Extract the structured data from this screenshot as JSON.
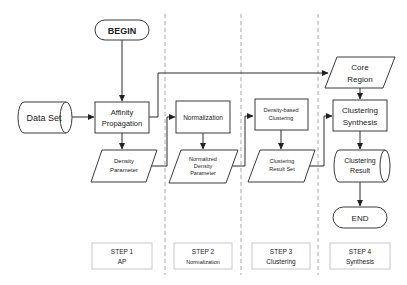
{
  "diagram": {
    "type": "flowchart",
    "nodes": {
      "begin": {
        "label": "BEGIN",
        "shape": "terminal"
      },
      "data_set": {
        "label": "Data Set",
        "shape": "cylinder"
      },
      "affinity": {
        "line1": "Affinity",
        "line2": "Propagation",
        "shape": "process"
      },
      "density_param": {
        "line1": "Density",
        "line2": "Parameter",
        "shape": "data"
      },
      "normalization": {
        "label": "Normalization",
        "shape": "process"
      },
      "norm_density_param": {
        "line1": "Normalized",
        "line2": "Density",
        "line3": "Parameter",
        "shape": "data"
      },
      "density_clustering": {
        "line1": "Density-based",
        "line2": "Clustering",
        "shape": "process"
      },
      "cluster_result_set": {
        "line1": "Clustering",
        "line2": "Result Set",
        "shape": "data"
      },
      "core_region": {
        "line1": "Core",
        "line2": "Region",
        "shape": "data"
      },
      "cluster_synthesis": {
        "line1": "Clustering",
        "line2": "Synthesis",
        "shape": "process"
      },
      "cluster_result": {
        "line1": "Clustering",
        "line2": "Result",
        "shape": "cylinder"
      },
      "end": {
        "label": "END",
        "shape": "terminal"
      }
    },
    "edges": [
      [
        "begin",
        "affinity"
      ],
      [
        "data_set",
        "affinity"
      ],
      [
        "affinity",
        "density_param"
      ],
      [
        "affinity",
        "core_region"
      ],
      [
        "density_param",
        "normalization"
      ],
      [
        "normalization",
        "norm_density_param"
      ],
      [
        "norm_density_param",
        "density_clustering"
      ],
      [
        "density_clustering",
        "cluster_result_set"
      ],
      [
        "cluster_result_set",
        "cluster_synthesis"
      ],
      [
        "core_region",
        "cluster_synthesis"
      ],
      [
        "cluster_synthesis",
        "cluster_result"
      ],
      [
        "cluster_result",
        "end"
      ]
    ],
    "steps": [
      {
        "title": "STEP 1",
        "subtitle": "AP"
      },
      {
        "title": "STEP 2",
        "subtitle": "Normalization"
      },
      {
        "title": "STEP 3",
        "subtitle": "Clustering"
      },
      {
        "title": "STEP 4",
        "subtitle": "Synthesis"
      }
    ],
    "colors": {
      "stroke": "#3a3a3a",
      "lane_divider": "#a8a8a8",
      "step_border": "#c8c8c8",
      "text": "#222222"
    }
  }
}
